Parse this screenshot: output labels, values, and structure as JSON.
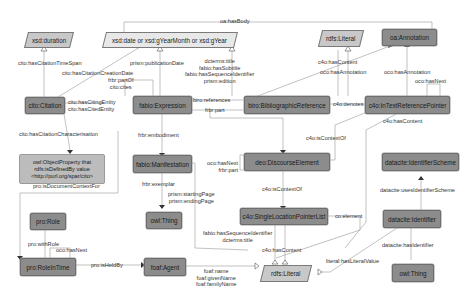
{
  "diagram": {
    "nodes": {
      "xsd_duration": "xsd:duration",
      "xsd_date": "xsd:date or xsd:gYearMonth or xsd:gYear",
      "rdfs_literal_top": "rdfs:Literal",
      "oa_annotation": "oa:Annotation",
      "cito_citation": "cito:Citation",
      "fabio_expression": "fabio:Expression",
      "biro_bibref": "biro:BibliographicReference",
      "c4o_intext": "c4o:InTextReferencePointer",
      "owl_objprop_line1": "owl:ObjectProperty that",
      "owl_objprop_line2": "rdfs:isDefinedBy value",
      "owl_objprop_line3": "<http://purl.org/spar/cito>",
      "fabio_manifestation": "fabio:Manifestation",
      "deo_discourse": "deo:DiscourseElement",
      "datacite_scheme": "datacite:IdentifierScheme",
      "owl_thing_left": "owl:Thing",
      "c4o_single": "c4o:SingleLocationPointerList",
      "datacite_identifier": "datacite:Identifier",
      "pro_role": "pro:Role",
      "pro_roleintime": "pro:RoleInTime",
      "foaf_agent": "foaf:Agent",
      "rdfs_literal_bottom": "rdfs:Literal",
      "owl_thing_right": "owl:Thing"
    },
    "edges": {
      "oa_hasbody": "oa:hasBody",
      "cito_timespan": "cito:hasCitationTimeSpan",
      "cito_creationdate": "cito:hasCitationCreationDate",
      "prism_pubdate": "prism:publicationDate",
      "frbr_partof_1": "frbr:partOf",
      "frbr_partof_2": "cito:cites",
      "dcterms_1": "dcterms:title",
      "dcterms_2": "fabio:hasSubtitle",
      "dcterms_3": "fabio:hasSequenceIdentifier",
      "dcterms_4": "prism:edition",
      "c4o_hascontent_top": "c4o:hasContent",
      "oco_hasannotation_1": "oco:hasAnnotation",
      "oco_hasannotation_2": "oco:hasAnnotation",
      "oco_hasnext_top": "oco:hasNext",
      "cito_citing_1": "cito:hasCitingEntity",
      "cito_citing_2": "cito:hasCitedEntity",
      "biro_references": "biro:references",
      "frbr_part_top": "frbr:part",
      "c4o_denotes": "c4o:denotes",
      "c4o_hascontent_mid": "c4o:hasContent",
      "c4o_iscontextof_mid": "c4o:isContextOf",
      "cito_characterisation": "cito:hasCitationCharacterisation",
      "frbr_embodiment": "frbr:embodiment",
      "oco_hasnext_mid_1": "oco:hasNext",
      "oco_hasnext_mid_2": "frbr:part",
      "pro_doccontext": "pro:isDocumentContextFor",
      "frbr_exemplar": "frbr:exemplar",
      "prism_pages_1": "prism:startingPage",
      "prism_pages_2": "prism:endingPage",
      "c4o_iscontextof_low": "c4o:isContextOf",
      "datacite_uses": "datacite:usesIdentifierScheme",
      "co_element": "co:element",
      "datacite_hasidentifier": "datacite:hasIdentifier",
      "fabio_seq_1": "fabio:hasSequenceIdentifier",
      "fabio_seq_2": "dcterms:title",
      "c4o_hascontent_low": "c4o:hasContent",
      "literal_value": "literal:hasLiteralValue",
      "pro_withrole": "pro:withRole",
      "oco_hasnext_low": "oco:hasNext",
      "pro_isheldby": "pro:isHeldBy",
      "foaf_1": "foaf:name",
      "foaf_2": "foaf:givenName",
      "foaf_3": "foaf:familyName"
    }
  }
}
